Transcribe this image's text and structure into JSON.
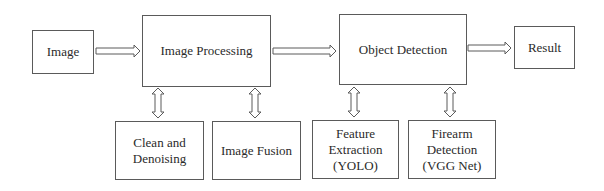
{
  "diagram": {
    "type": "flowchart",
    "colors": {
      "stroke": "#5a5a5a",
      "text": "#2a2a2a",
      "background": "#ffffff"
    },
    "nodes": {
      "image": {
        "label": "Image"
      },
      "image_processing": {
        "label": "Image Processing"
      },
      "object_detection": {
        "label": "Object Detection"
      },
      "result": {
        "label": "Result"
      },
      "clean_denoising": {
        "label": "Clean and\nDenoising"
      },
      "image_fusion": {
        "label": "Image Fusion"
      },
      "feature_extraction": {
        "label": "Feature\nExtraction\n(YOLO)"
      },
      "firearm_detection": {
        "label": "Firearm\nDetection\n(VGG Net)"
      }
    },
    "edges": [
      {
        "from": "image",
        "to": "image_processing",
        "style": "hollow-arrow"
      },
      {
        "from": "image_processing",
        "to": "object_detection",
        "style": "hollow-arrow"
      },
      {
        "from": "object_detection",
        "to": "result",
        "style": "hollow-arrow"
      },
      {
        "from": "image_processing",
        "to": "clean_denoising",
        "style": "hollow-double-arrow"
      },
      {
        "from": "image_processing",
        "to": "image_fusion",
        "style": "hollow-double-arrow"
      },
      {
        "from": "object_detection",
        "to": "feature_extraction",
        "style": "hollow-double-arrow"
      },
      {
        "from": "object_detection",
        "to": "firearm_detection",
        "style": "hollow-double-arrow"
      }
    ]
  }
}
